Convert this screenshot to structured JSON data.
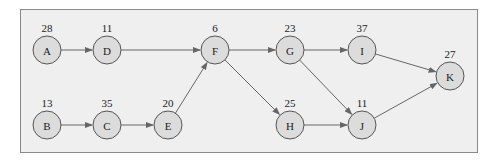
{
  "diagram": {
    "type": "activity-on-node network",
    "nodes": [
      {
        "id": "A",
        "label": "A",
        "duration": "28",
        "x": 47,
        "y": 50
      },
      {
        "id": "D",
        "label": "D",
        "duration": "11",
        "x": 107,
        "y": 50
      },
      {
        "id": "F",
        "label": "F",
        "duration": "6",
        "x": 215,
        "y": 50
      },
      {
        "id": "G",
        "label": "G",
        "duration": "23",
        "x": 290,
        "y": 50
      },
      {
        "id": "I",
        "label": "I",
        "duration": "37",
        "x": 362,
        "y": 50
      },
      {
        "id": "K",
        "label": "K",
        "duration": "27",
        "x": 450,
        "y": 76
      },
      {
        "id": "B",
        "label": "B",
        "duration": "13",
        "x": 47,
        "y": 125
      },
      {
        "id": "C",
        "label": "C",
        "duration": "35",
        "x": 107,
        "y": 125
      },
      {
        "id": "E",
        "label": "E",
        "duration": "20",
        "x": 168,
        "y": 125
      },
      {
        "id": "H",
        "label": "H",
        "duration": "25",
        "x": 290,
        "y": 125
      },
      {
        "id": "J",
        "label": "J",
        "duration": "11",
        "x": 362,
        "y": 125
      }
    ],
    "edges": [
      {
        "from": "A",
        "to": "D"
      },
      {
        "from": "D",
        "to": "F"
      },
      {
        "from": "B",
        "to": "C"
      },
      {
        "from": "C",
        "to": "E"
      },
      {
        "from": "E",
        "to": "F"
      },
      {
        "from": "F",
        "to": "G"
      },
      {
        "from": "F",
        "to": "H"
      },
      {
        "from": "G",
        "to": "I"
      },
      {
        "from": "G",
        "to": "J"
      },
      {
        "from": "H",
        "to": "J"
      },
      {
        "from": "I",
        "to": "K"
      },
      {
        "from": "J",
        "to": "K"
      }
    ],
    "colors": {
      "node_fill": "#dcdcdc",
      "node_stroke": "#555555",
      "edge": "#666666",
      "background": "#efefef"
    }
  }
}
